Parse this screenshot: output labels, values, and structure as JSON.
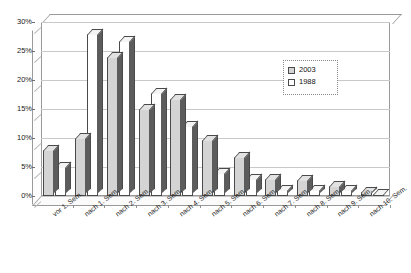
{
  "chart_data": {
    "type": "bar",
    "title": "",
    "subtitle": "",
    "xlabel": "",
    "ylabel": "",
    "ylim": [
      0,
      30
    ],
    "ytick_labels": [
      "0%",
      "5%",
      "10%",
      "15%",
      "20%",
      "25%",
      "30%"
    ],
    "ytick_values": [
      0,
      5,
      10,
      15,
      20,
      25,
      30
    ],
    "grid": true,
    "legend_position": "inside-upper-right",
    "categories": [
      "vor 1. Sem.",
      "nach 1. Sem.",
      "nach 2. Sem.",
      "nach 3. Sem.",
      "nach 4. Sem.",
      "nach 5. Sem.",
      "nach 6. Sem.",
      "nach 7. Sem.",
      "nach 8. Sem.",
      "nach 9. Sem.",
      "nach 10. Sem."
    ],
    "series": [
      {
        "name": "2003",
        "color": "#d4d4d4",
        "values": [
          8.0,
          10.0,
          24.0,
          15.0,
          16.7,
          9.7,
          6.8,
          3.0,
          2.8,
          1.8,
          0.7
        ]
      },
      {
        "name": "1988",
        "color": "#ffffff",
        "values": [
          5.0,
          28.0,
          26.8,
          17.8,
          12.0,
          4.0,
          3.0,
          1.0,
          1.0,
          1.0,
          0.2
        ]
      }
    ]
  },
  "legend": {
    "entries": [
      {
        "label": "2003",
        "swatch": "filled-gray"
      },
      {
        "label": "1988",
        "swatch": "outline-white"
      }
    ]
  }
}
